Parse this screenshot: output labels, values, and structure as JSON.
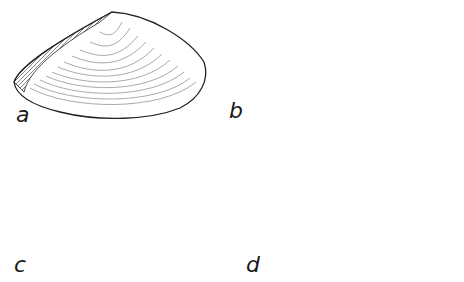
{
  "figure": {
    "panels": [
      {
        "id": "a",
        "label": "a",
        "view": "exterior-left-valve-oblique"
      },
      {
        "id": "b",
        "label": "b",
        "view": "dorsal-view"
      },
      {
        "id": "c",
        "label": "c",
        "view": "interior-valve"
      },
      {
        "id": "d",
        "label": "d",
        "view": "exterior-valve"
      }
    ],
    "colors": {
      "ink": "#1a1a1a",
      "paper": "#ffffff",
      "shade": "#555555"
    }
  }
}
